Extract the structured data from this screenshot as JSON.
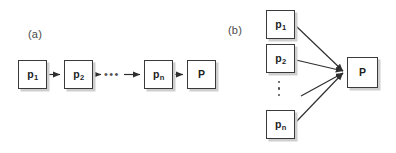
{
  "figure": {
    "width": 396,
    "height": 153,
    "background": "#ffffff",
    "stroke_color": "#3a3a3a",
    "shadow_color": "#cfcfcf",
    "text_color": "#1d1d1d"
  },
  "panels": [
    {
      "id": "panel-a",
      "label": "(a)",
      "label_pos": {
        "x": 28,
        "y": 28
      },
      "type": "linear-chain",
      "nodes": [
        {
          "id": "a-p1",
          "label": "p",
          "sub": "1",
          "x": 18,
          "y": 60,
          "w": 29,
          "h": 29
        },
        {
          "id": "a-p2",
          "label": "p",
          "sub": "2",
          "x": 64,
          "y": 60,
          "w": 29,
          "h": 29
        },
        {
          "id": "a-pn",
          "label": "p",
          "sub": "n",
          "x": 144,
          "y": 60,
          "w": 29,
          "h": 29
        },
        {
          "id": "a-p",
          "label": "P",
          "sub": "",
          "x": 187,
          "y": 60,
          "w": 29,
          "h": 29
        }
      ],
      "ellipsis": {
        "type": "horizontal",
        "text": "•••",
        "x": 105,
        "y": 70
      },
      "edges": [
        {
          "from": "a-p1",
          "to": "a-p2",
          "x1": 47,
          "y1": 74.5,
          "x2": 62,
          "y2": 74.5
        },
        {
          "from": "a-p2",
          "to": "ellipsis",
          "x1": 93,
          "y1": 74.5,
          "x2": 103,
          "y2": 74.5
        },
        {
          "from": "ellipsis",
          "to": "a-pn",
          "x1": 124,
          "y1": 74.5,
          "x2": 142,
          "y2": 74.5
        },
        {
          "from": "a-pn",
          "to": "a-p",
          "x1": 173,
          "y1": 74.5,
          "x2": 185,
          "y2": 74.5
        }
      ]
    },
    {
      "id": "panel-b",
      "label": "(b)",
      "label_pos": {
        "x": 228,
        "y": 24
      },
      "type": "fan-in",
      "nodes": [
        {
          "id": "b-p1",
          "label": "p",
          "sub": "1",
          "x": 266,
          "y": 10,
          "w": 29,
          "h": 29
        },
        {
          "id": "b-p2",
          "label": "p",
          "sub": "2",
          "x": 266,
          "y": 44,
          "w": 29,
          "h": 29
        },
        {
          "id": "b-pn",
          "label": "p",
          "sub": "n",
          "x": 266,
          "y": 110,
          "w": 29,
          "h": 29
        },
        {
          "id": "b-p",
          "label": "P",
          "sub": "",
          "x": 347,
          "y": 57,
          "w": 31,
          "h": 31
        }
      ],
      "ellipsis": {
        "type": "vertical",
        "x": 277,
        "y": 81,
        "dots": 3
      },
      "edges": [
        {
          "from": "b-p1",
          "to": "b-p",
          "x1": 296,
          "y1": 26,
          "x2": 345,
          "y2": 72
        },
        {
          "from": "b-p2",
          "to": "b-p",
          "x1": 296,
          "y1": 60,
          "x2": 345,
          "y2": 72
        },
        {
          "from": "ellipsis",
          "to": "b-p",
          "x1": 301,
          "y1": 96,
          "x2": 345,
          "y2": 72
        },
        {
          "from": "b-pn",
          "to": "b-p",
          "x1": 296,
          "y1": 122,
          "x2": 345,
          "y2": 72
        }
      ]
    }
  ]
}
